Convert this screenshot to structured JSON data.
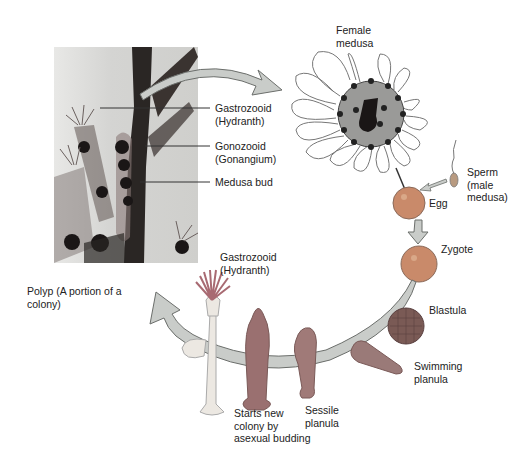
{
  "diagram": {
    "photo_labels": {
      "gastrozooid": "Gastrozooid\n(Hydranth)",
      "gonozooid": "Gonozooid\n(Gonangium)",
      "medusa_bud": "Medusa bud"
    },
    "stages": {
      "female_medusa": "Female\nmedusa",
      "sperm": "Sperm\n(male\nmedusa)",
      "egg": "Egg",
      "zygote": "Zygote",
      "blastula": "Blastula",
      "swimming_planula": "Swimming\nplanula",
      "sessile_planula": "Sessile\nplanula",
      "new_colony": "Starts new\ncolony by\nasexual budding",
      "gastrozooid_polyp": "Gastrozooid\n(Hydranth)",
      "polyp": "Polyp (A portion of a\ncolony)"
    },
    "colors": {
      "arrow_fill": "#c9ccc9",
      "arrow_stroke": "#6b6e6b",
      "egg": "#c98a6a",
      "blastula": "#7a5a55",
      "planula": "#9a7a78",
      "hydranth": "#a86a72"
    }
  }
}
